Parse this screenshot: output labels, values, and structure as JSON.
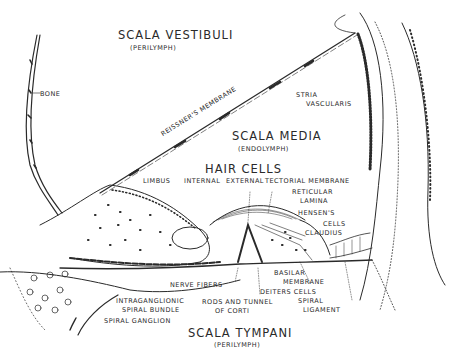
{
  "figure": {
    "ink_color": "#2a2a2a",
    "paper_color": "#ffffff"
  },
  "labels": {
    "scala_vestibuli": "SCALA VESTIBULI",
    "scala_vestibuli_sub": "(PERILYMPH)",
    "bone": "BONE",
    "reissners_membrane": "REISSNER'S MEMBRANE",
    "stria_vascularis_1": "STRIA",
    "stria_vascularis_2": "VASCULARIS",
    "scala_media": "SCALA MEDIA",
    "scala_media_sub": "(ENDOLYMPH)",
    "hair_cells": "HAIR CELLS",
    "limbus": "LIMBUS",
    "internal": "INTERNAL",
    "external": "EXTERNAL",
    "tectorial_membrane": "TECTORIAL MEMBRANE",
    "reticular_lamina_1": "RETICULAR",
    "reticular_lamina_2": "LAMINA",
    "hensens_cells_1": "HENSEN'S",
    "hensens_cells_2": "CELLS",
    "claudius": "CLAUDIUS",
    "basilar_membrane_1": "BASILAR",
    "basilar_membrane_2": "MEMBRANE",
    "deiters_cells": "DEITERS CELLS",
    "nerve_fibers": "NERVE FIBERS",
    "intraganglionic_1": "INTRAGANGLIONIC",
    "intraganglionic_2": "SPIRAL BUNDLE",
    "rods_tunnel_1": "RODS AND TUNNEL",
    "rods_tunnel_2": "OF CORTI",
    "spiral_ligament_1": "SPIRAL",
    "spiral_ligament_2": "LIGAMENT",
    "spiral_ganglion": "SPIRAL GANGLION",
    "scala_tympani": "SCALA TYMPANI",
    "scala_tympani_sub": "(PERILYMPH)"
  }
}
